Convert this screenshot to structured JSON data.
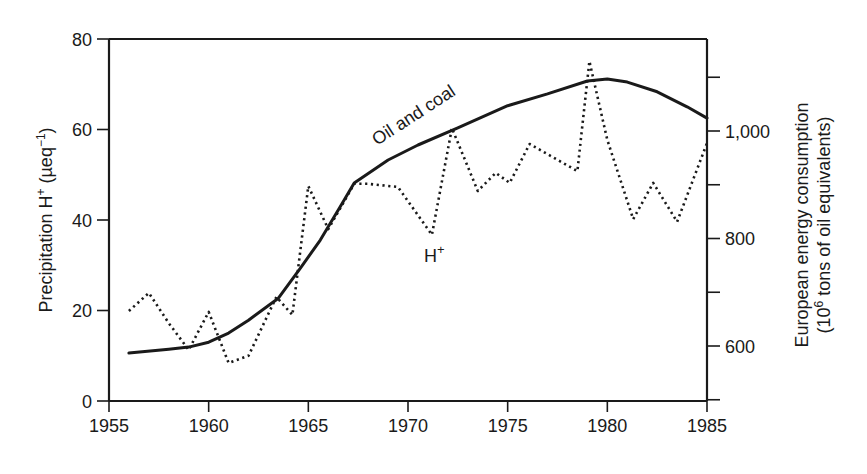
{
  "chart_data": {
    "type": "line",
    "title": "",
    "xlabel": "",
    "ylabel": "Precipitation H+ (µeq-1)",
    "ylabel_parts": {
      "base": "Precipitation H",
      "sup1": "+",
      "mid": " (µeq",
      "sup2": "−1",
      "end": ")"
    },
    "y2label_line1": "European energy consumption",
    "y2label_line2_parts": {
      "pre": "(10",
      "sup": "6",
      "post": " tons of oil equivalents)"
    },
    "xlim": [
      1955,
      1985
    ],
    "ylim": [
      0,
      80
    ],
    "y2lim": [
      500,
      1170
    ],
    "x_ticks": [
      1955,
      1960,
      1965,
      1970,
      1975,
      1980,
      1985
    ],
    "x_tick_labels": [
      "1955",
      "1960",
      "1965",
      "1970",
      "1975",
      "1980",
      "1985"
    ],
    "y_ticks": [
      0,
      20,
      40,
      60,
      80
    ],
    "y_tick_labels": [
      "0",
      "20",
      "40",
      "60",
      "80"
    ],
    "y2_major_ticks": [
      600,
      800,
      1000
    ],
    "y2_tick_labels": [
      "600",
      "800",
      "1,000"
    ],
    "y2_minor_ticks": [
      500,
      700,
      900,
      1100
    ],
    "grid": false,
    "legend": "none (inline annotations)",
    "annotations": [
      {
        "text": "Oil and coal",
        "series": "Oil and coal",
        "rotation_deg": -33
      },
      {
        "text_base": "H",
        "text_sup": "+",
        "series": "H+"
      }
    ],
    "series": [
      {
        "name": "H+",
        "axis": "left",
        "style": "dotted",
        "x": [
          1956,
          1957,
          1958,
          1959,
          1960,
          1961,
          1962,
          1963.4,
          1964.2,
          1965,
          1966,
          1967.3,
          1968,
          1969.5,
          1971.2,
          1972.2,
          1973.5,
          1974.4,
          1975.1,
          1976.1,
          1978.5,
          1979.1,
          1980,
          1981.3,
          1982.3,
          1983.5,
          1985
        ],
        "values": [
          19.9,
          23.9,
          17.2,
          11.3,
          19.7,
          8.4,
          10.0,
          23.0,
          19.0,
          47.5,
          38.0,
          48.0,
          48.0,
          47.3,
          36.7,
          60.3,
          46.4,
          50.4,
          48.2,
          56.8,
          50.8,
          75.1,
          57.7,
          40.2,
          48.2,
          39.6,
          57.0
        ]
      },
      {
        "name": "Oil and coal",
        "axis": "right",
        "style": "solid",
        "x": [
          1956,
          1958,
          1959,
          1960,
          1961,
          1962,
          1963.5,
          1964.6,
          1965.6,
          1966.6,
          1967.3,
          1969,
          1970.5,
          1972.5,
          1975,
          1977,
          1979,
          1980,
          1981,
          1982.5,
          1984,
          1985
        ],
        "values": [
          587,
          594,
          598,
          607,
          624,
          648,
          689,
          745,
          797,
          859,
          903,
          946,
          974,
          1006,
          1047,
          1069,
          1093,
          1097,
          1091,
          1073,
          1045,
          1024
        ]
      }
    ],
    "colors": {
      "line": "#1a1a1a",
      "background": "#ffffff"
    }
  }
}
